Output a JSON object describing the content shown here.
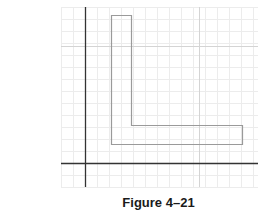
{
  "figure": {
    "caption": "Figure 4–21",
    "grid": {
      "x_start": 61,
      "x_end": 258,
      "y_start": 7,
      "y_end": 187,
      "spacing": 12,
      "minor_color": "#ececec",
      "major_color": "#d4d4d4",
      "major_x": [
        199
      ],
      "major_y": [
        46
      ]
    },
    "axes": {
      "color": "#333333",
      "vertical_x": 85,
      "vertical_y_range": [
        7,
        187
      ],
      "horizontal_y": 163,
      "horizontal_x_range": [
        61,
        258
      ]
    },
    "l_shape": {
      "stroke": "#9a9a9a",
      "points": [
        [
          111,
          15
        ],
        [
          131,
          15
        ],
        [
          131,
          125
        ],
        [
          242,
          125
        ],
        [
          242,
          144
        ],
        [
          111,
          144
        ]
      ]
    }
  }
}
